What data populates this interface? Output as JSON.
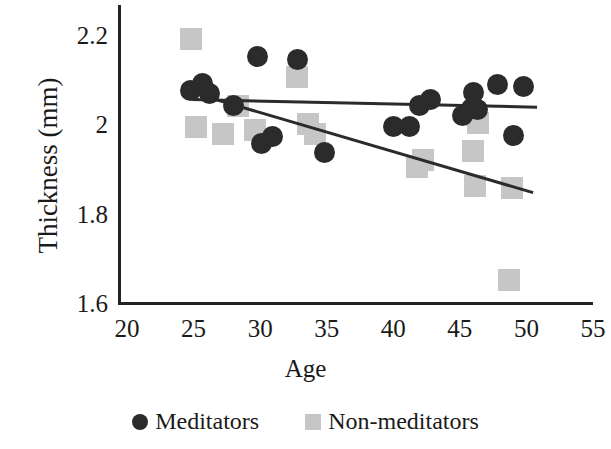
{
  "chart_data": {
    "type": "scatter",
    "title": "",
    "xlabel": "Age",
    "ylabel": "Thickness (mm)",
    "xlim": [
      20,
      55
    ],
    "ylim": [
      1.6,
      2.2
    ],
    "xticks": [
      20,
      25,
      30,
      35,
      40,
      45,
      50,
      55
    ],
    "xtick_labels": [
      "20",
      "25",
      "30",
      "35",
      "40",
      "45",
      "50",
      "55"
    ],
    "yticks": [
      1.6,
      1.8,
      2.0,
      2.2
    ],
    "ytick_labels": [
      "1.6",
      "1.8",
      "2",
      "2.2"
    ],
    "grid": false,
    "legend_position": "below",
    "colors": {
      "meditators": "#2b2b2b",
      "non_meditators": "#c6c6c6",
      "axis": "#232323",
      "trendline": "#2b2b2b"
    },
    "series": [
      {
        "name": "Meditators",
        "marker": "circle",
        "color": "#2b2b2b",
        "points": [
          {
            "x": 24.8,
            "y": 2.075
          },
          {
            "x": 25.7,
            "y": 2.092
          },
          {
            "x": 26.2,
            "y": 2.068
          },
          {
            "x": 28.0,
            "y": 2.043
          },
          {
            "x": 29.8,
            "y": 2.152
          },
          {
            "x": 30.1,
            "y": 1.957
          },
          {
            "x": 30.9,
            "y": 1.972
          },
          {
            "x": 32.8,
            "y": 2.145
          },
          {
            "x": 34.8,
            "y": 1.938
          },
          {
            "x": 40.0,
            "y": 1.995
          },
          {
            "x": 41.2,
            "y": 1.995
          },
          {
            "x": 42.0,
            "y": 2.043
          },
          {
            "x": 42.8,
            "y": 2.056
          },
          {
            "x": 45.2,
            "y": 2.02
          },
          {
            "x": 45.9,
            "y": 2.035
          },
          {
            "x": 46.0,
            "y": 2.072
          },
          {
            "x": 46.3,
            "y": 2.033
          },
          {
            "x": 47.8,
            "y": 2.09
          },
          {
            "x": 49.0,
            "y": 1.975
          },
          {
            "x": 49.8,
            "y": 2.085
          }
        ]
      },
      {
        "name": "Non-meditators",
        "marker": "square",
        "color": "#c6c6c6",
        "points": [
          {
            "x": 24.8,
            "y": 2.192
          },
          {
            "x": 25.2,
            "y": 1.995
          },
          {
            "x": 27.2,
            "y": 1.978
          },
          {
            "x": 28.3,
            "y": 2.042
          },
          {
            "x": 29.6,
            "y": 1.988
          },
          {
            "x": 32.8,
            "y": 2.105
          },
          {
            "x": 33.6,
            "y": 2.0
          },
          {
            "x": 34.1,
            "y": 1.978
          },
          {
            "x": 41.8,
            "y": 1.905
          },
          {
            "x": 42.2,
            "y": 1.92
          },
          {
            "x": 46.0,
            "y": 1.94
          },
          {
            "x": 46.4,
            "y": 2.002
          },
          {
            "x": 46.1,
            "y": 1.862
          },
          {
            "x": 48.9,
            "y": 1.858
          },
          {
            "x": 48.7,
            "y": 1.652
          }
        ]
      }
    ],
    "trendlines": [
      {
        "name": "Meditators trend",
        "series": "Meditators",
        "color": "#2b2b2b",
        "x_start": 24.9,
        "y_start": 2.0555,
        "x_end": 50.8,
        "y_end": 2.0385
      },
      {
        "name": "Non-meditators trend",
        "series": "Non-meditators",
        "color": "#2b2b2b",
        "x_start": 24.9,
        "y_start": 2.071,
        "x_end": 50.5,
        "y_end": 1.847
      }
    ]
  },
  "legend": {
    "items": [
      {
        "label": "Meditators",
        "marker": "circle"
      },
      {
        "label": "Non-meditators",
        "marker": "square"
      }
    ]
  }
}
